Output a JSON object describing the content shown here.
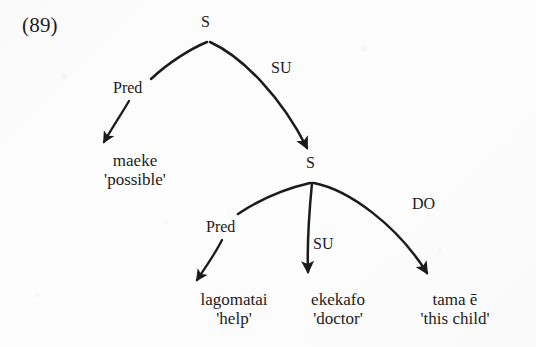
{
  "figure": {
    "example_number": "(89)",
    "type": "functional-grammar-tree",
    "ink_color": "#1b1b1b",
    "background_color": "#fdfdfd"
  },
  "nodes": {
    "root_s": "S",
    "embedded_s": "S"
  },
  "relations": {
    "upper_pred": "Pred",
    "upper_su": "SU",
    "lower_pred": "Pred",
    "lower_su": "SU",
    "lower_do": "DO"
  },
  "leaves": [
    {
      "form": "maeke",
      "gloss": "'possible'"
    },
    {
      "form": "lagomatai",
      "gloss": "'help'"
    },
    {
      "form": "ekekafo",
      "gloss": "'doctor'"
    },
    {
      "form": "tama ē",
      "gloss": "'this child'"
    }
  ]
}
